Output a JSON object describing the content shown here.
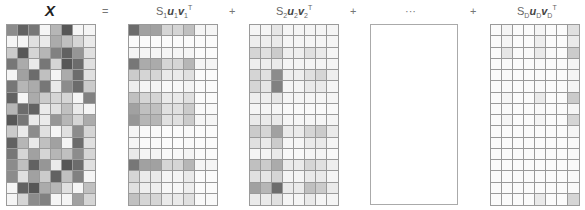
{
  "equation": {
    "lhs_label": "X",
    "equals": "=",
    "plus": "+",
    "ellipsis": "···",
    "terms": [
      {
        "s": "S",
        "s_sub": "1",
        "u": "u",
        "u_sub": "1",
        "v": "v",
        "v_sub": "1",
        "t": "T"
      },
      {
        "s": "S",
        "s_sub": "2",
        "u": "u",
        "u_sub": "2",
        "v": "v",
        "v_sub": "2",
        "t": "T"
      },
      {
        "s": "S",
        "s_sub": "D",
        "u": "u",
        "u_sub": "D",
        "v": "v",
        "v_sub": "D",
        "t": "T"
      }
    ]
  },
  "matrices": {
    "rows": 16,
    "cols": 8,
    "X": [
      [
        0.55,
        0.75,
        0.65,
        0.05,
        0.35,
        0.8,
        0.05,
        0.05
      ],
      [
        0.05,
        0.05,
        0.15,
        0.1,
        0.4,
        0.3,
        0.2,
        0.1
      ],
      [
        0.25,
        0.8,
        0.2,
        0.35,
        0.6,
        0.75,
        0.5,
        0.15
      ],
      [
        0.65,
        0.4,
        0.1,
        0.65,
        0.2,
        0.8,
        0.7,
        0.15
      ],
      [
        0.05,
        0.45,
        0.7,
        0.3,
        0.05,
        0.4,
        0.7,
        0.15
      ],
      [
        0.65,
        0.35,
        0.4,
        0.65,
        0.1,
        0.55,
        0.7,
        0.25
      ],
      [
        0.75,
        0.05,
        0.4,
        0.25,
        0.2,
        0.2,
        0.05,
        0.6
      ],
      [
        0.35,
        0.7,
        0.75,
        0.1,
        0.15,
        0.3,
        0.1,
        0.05
      ],
      [
        0.8,
        0.65,
        0.1,
        0.1,
        0.5,
        0.35,
        0.2,
        0.4
      ],
      [
        0.25,
        0.1,
        0.55,
        0.15,
        0.05,
        0.15,
        0.55,
        0.2
      ],
      [
        0.75,
        0.35,
        0.1,
        0.3,
        0.45,
        0.05,
        0.7,
        0.15
      ],
      [
        0.65,
        0.2,
        0.45,
        0.2,
        0.35,
        0.3,
        0.55,
        0.2
      ],
      [
        0.55,
        0.3,
        0.75,
        0.5,
        0.1,
        0.8,
        0.7,
        0.15
      ],
      [
        0.55,
        0.15,
        0.45,
        0.25,
        0.75,
        0.3,
        0.6,
        0.05
      ],
      [
        0.05,
        0.75,
        0.8,
        0.4,
        0.35,
        0.15,
        0.05,
        0.3
      ],
      [
        0.05,
        0.2,
        0.55,
        0.6,
        0.05,
        0.05,
        0.45,
        0.2
      ]
    ],
    "S1": [
      [
        0.7,
        0.45,
        0.45,
        0.2,
        0.2,
        0.3,
        0.05,
        0.05
      ],
      [
        0.02,
        0.02,
        0.02,
        0.02,
        0.02,
        0.02,
        0.02,
        0.02
      ],
      [
        0.05,
        0.05,
        0.05,
        0.05,
        0.05,
        0.05,
        0.02,
        0.02
      ],
      [
        0.65,
        0.4,
        0.4,
        0.2,
        0.2,
        0.35,
        0.05,
        0.05
      ],
      [
        0.25,
        0.2,
        0.2,
        0.1,
        0.1,
        0.15,
        0.02,
        0.02
      ],
      [
        0.08,
        0.05,
        0.05,
        0.03,
        0.03,
        0.05,
        0.02,
        0.02
      ],
      [
        0.3,
        0.2,
        0.2,
        0.1,
        0.1,
        0.15,
        0.02,
        0.02
      ],
      [
        0.45,
        0.3,
        0.3,
        0.15,
        0.15,
        0.25,
        0.03,
        0.03
      ],
      [
        0.5,
        0.35,
        0.35,
        0.15,
        0.15,
        0.25,
        0.05,
        0.05
      ],
      [
        0.05,
        0.03,
        0.03,
        0.02,
        0.02,
        0.03,
        0.02,
        0.02
      ],
      [
        0.05,
        0.03,
        0.03,
        0.02,
        0.02,
        0.03,
        0.02,
        0.02
      ],
      [
        0.1,
        0.05,
        0.05,
        0.03,
        0.03,
        0.05,
        0.02,
        0.02
      ],
      [
        0.65,
        0.45,
        0.45,
        0.2,
        0.2,
        0.35,
        0.05,
        0.05
      ],
      [
        0.2,
        0.1,
        0.1,
        0.05,
        0.05,
        0.1,
        0.02,
        0.02
      ],
      [
        0.15,
        0.08,
        0.08,
        0.04,
        0.04,
        0.08,
        0.02,
        0.02
      ],
      [
        0.3,
        0.2,
        0.2,
        0.1,
        0.1,
        0.15,
        0.03,
        0.03
      ]
    ],
    "S2": [
      [
        0.05,
        0.05,
        0.12,
        0.05,
        0.05,
        0.05,
        0.05,
        0.05
      ],
      [
        0.08,
        0.08,
        0.1,
        0.05,
        0.05,
        0.05,
        0.05,
        0.05
      ],
      [
        0.2,
        0.15,
        0.25,
        0.08,
        0.08,
        0.15,
        0.1,
        0.05
      ],
      [
        0.08,
        0.08,
        0.1,
        0.05,
        0.05,
        0.05,
        0.05,
        0.05
      ],
      [
        0.2,
        0.15,
        0.55,
        0.08,
        0.08,
        0.15,
        0.2,
        0.08
      ],
      [
        0.2,
        0.12,
        0.6,
        0.05,
        0.05,
        0.1,
        0.1,
        0.05
      ],
      [
        0.08,
        0.08,
        0.12,
        0.05,
        0.05,
        0.05,
        0.05,
        0.05
      ],
      [
        0.05,
        0.05,
        0.05,
        0.03,
        0.03,
        0.03,
        0.03,
        0.03
      ],
      [
        0.1,
        0.1,
        0.1,
        0.05,
        0.05,
        0.05,
        0.05,
        0.05
      ],
      [
        0.25,
        0.2,
        0.45,
        0.1,
        0.1,
        0.2,
        0.25,
        0.1
      ],
      [
        0.15,
        0.1,
        0.25,
        0.05,
        0.05,
        0.1,
        0.1,
        0.05
      ],
      [
        0.05,
        0.05,
        0.1,
        0.03,
        0.03,
        0.05,
        0.05,
        0.03
      ],
      [
        0.3,
        0.25,
        0.4,
        0.1,
        0.1,
        0.2,
        0.15,
        0.08
      ],
      [
        0.15,
        0.12,
        0.2,
        0.05,
        0.05,
        0.1,
        0.1,
        0.05
      ],
      [
        0.45,
        0.35,
        0.7,
        0.1,
        0.1,
        0.3,
        0.25,
        0.1
      ],
      [
        0.1,
        0.1,
        0.15,
        0.05,
        0.05,
        0.1,
        0.05,
        0.05
      ]
    ],
    "SD": [
      [
        0.02,
        0.05,
        0.02,
        0.02,
        0.05,
        0.02,
        0.02,
        0.15
      ],
      [
        0.02,
        0.05,
        0.02,
        0.02,
        0.08,
        0.02,
        0.02,
        0.1
      ],
      [
        0.02,
        0.12,
        0.03,
        0.03,
        0.1,
        0.03,
        0.02,
        0.25
      ],
      [
        0.02,
        0.03,
        0.02,
        0.02,
        0.03,
        0.02,
        0.02,
        0.05
      ],
      [
        0.02,
        0.03,
        0.02,
        0.02,
        0.03,
        0.02,
        0.02,
        0.05
      ],
      [
        0.02,
        0.03,
        0.02,
        0.02,
        0.03,
        0.02,
        0.02,
        0.05
      ],
      [
        0.02,
        0.05,
        0.02,
        0.02,
        0.1,
        0.02,
        0.02,
        0.25
      ],
      [
        0.02,
        0.03,
        0.02,
        0.02,
        0.03,
        0.02,
        0.02,
        0.05
      ],
      [
        0.02,
        0.05,
        0.02,
        0.02,
        0.05,
        0.02,
        0.02,
        0.2
      ],
      [
        0.02,
        0.02,
        0.02,
        0.02,
        0.02,
        0.02,
        0.02,
        0.05
      ],
      [
        0.02,
        0.02,
        0.02,
        0.02,
        0.02,
        0.02,
        0.02,
        0.03
      ],
      [
        0.02,
        0.02,
        0.02,
        0.02,
        0.02,
        0.02,
        0.02,
        0.03
      ],
      [
        0.02,
        0.02,
        0.02,
        0.02,
        0.02,
        0.02,
        0.02,
        0.03
      ],
      [
        0.02,
        0.02,
        0.02,
        0.02,
        0.02,
        0.02,
        0.02,
        0.03
      ],
      [
        0.02,
        0.02,
        0.02,
        0.02,
        0.02,
        0.02,
        0.02,
        0.03
      ],
      [
        0.02,
        0.02,
        0.02,
        0.02,
        0.1,
        0.02,
        0.02,
        0.2
      ]
    ]
  },
  "colors": {
    "grid_line": "#9a9a9a",
    "cell_dark": "#333333",
    "cell_light": "#ffffff"
  }
}
